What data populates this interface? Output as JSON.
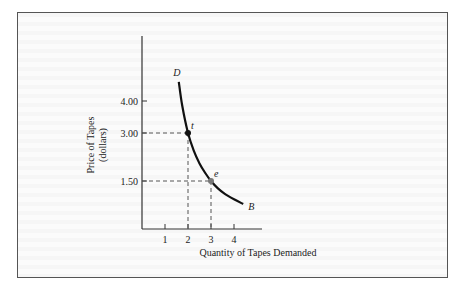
{
  "chart_data": {
    "type": "line",
    "title": "",
    "xlabel": "Quantity of Tapes Demanded",
    "ylabel": "Price of Tapes",
    "ylabel_unit": "(dollars)",
    "xlim": [
      0,
      5
    ],
    "ylim": [
      0,
      6
    ],
    "x_ticks": [
      1,
      2,
      3,
      4
    ],
    "y_ticks": [
      {
        "value": 1.5,
        "label": "1.50"
      },
      {
        "value": 3.0,
        "label": "3.00"
      },
      {
        "value": 4.0,
        "label": "4.00"
      }
    ],
    "grid": false,
    "legend": "none",
    "series": [
      {
        "name": "Demand curve DB",
        "start_label": "D",
        "end_label": "B",
        "x": [
          1.6,
          1.75,
          2.0,
          2.25,
          2.5,
          2.75,
          3.0,
          3.3,
          3.6,
          4.0,
          4.4
        ],
        "y": [
          4.6,
          3.85,
          3.0,
          2.45,
          2.05,
          1.75,
          1.5,
          1.27,
          1.1,
          0.93,
          0.78
        ]
      }
    ],
    "points": [
      {
        "label": "t",
        "x": 2,
        "y": 3.0,
        "color": "#111111",
        "guides": true
      },
      {
        "label": "e",
        "x": 3,
        "y": 1.5,
        "color": "#777777",
        "guides": true
      }
    ]
  },
  "colors": {
    "axis": "#333333",
    "curve": "#111111",
    "guide": "#555555",
    "frame": "#555555"
  }
}
